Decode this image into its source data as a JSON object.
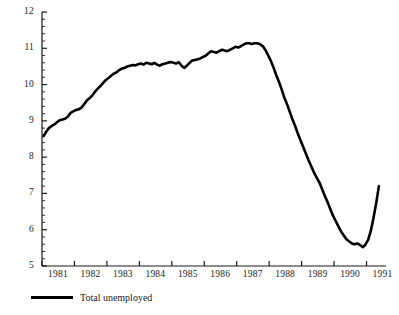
{
  "chart_data": {
    "type": "line",
    "title": "",
    "xlabel": "",
    "ylabel": "",
    "xlim": [
      1981.0,
      1991.6
    ],
    "ylim": [
      5,
      12
    ],
    "ytick_labels": [
      "5",
      "6",
      "7",
      "8",
      "9",
      "10",
      "11",
      "12"
    ],
    "ytick_values": [
      5,
      6,
      7,
      8,
      9,
      10,
      11,
      12
    ],
    "yminor_per_interval": 4,
    "xtick_labels": [
      "1981",
      "1982",
      "1983",
      "1984",
      "1985",
      "1986",
      "1987",
      "1988",
      "1989",
      "1990",
      "1991"
    ],
    "xtick_values": [
      1981,
      1982,
      1983,
      1984,
      1985,
      1986,
      1987,
      1988,
      1989,
      1990,
      1991
    ],
    "grid": false,
    "legend_position": "below-left",
    "series": [
      {
        "name": "Total unemployed",
        "color": "#000000",
        "line_width": 2.6,
        "x": [
          1981.05,
          1981.13,
          1981.21,
          1981.3,
          1981.38,
          1981.46,
          1981.55,
          1981.63,
          1981.71,
          1981.8,
          1981.88,
          1981.96,
          1982.05,
          1982.13,
          1982.21,
          1982.3,
          1982.38,
          1982.46,
          1982.55,
          1982.63,
          1982.71,
          1982.8,
          1982.88,
          1982.96,
          1983.05,
          1983.13,
          1983.21,
          1983.3,
          1983.38,
          1983.46,
          1983.55,
          1983.63,
          1983.71,
          1983.8,
          1983.88,
          1983.96,
          1984.05,
          1984.13,
          1984.21,
          1984.3,
          1984.38,
          1984.46,
          1984.55,
          1984.63,
          1984.71,
          1984.8,
          1984.88,
          1984.96,
          1985.05,
          1985.13,
          1985.21,
          1985.3,
          1985.38,
          1985.46,
          1985.55,
          1985.63,
          1985.71,
          1985.8,
          1985.88,
          1985.96,
          1986.05,
          1986.13,
          1986.21,
          1986.3,
          1986.38,
          1986.46,
          1986.55,
          1986.63,
          1986.71,
          1986.8,
          1986.88,
          1986.96,
          1987.05,
          1987.13,
          1987.21,
          1987.3,
          1987.38,
          1987.46,
          1987.55,
          1987.63,
          1987.71,
          1987.8,
          1987.88,
          1987.96,
          1988.05,
          1988.13,
          1988.21,
          1988.3,
          1988.38,
          1988.46,
          1988.55,
          1988.63,
          1988.71,
          1988.8,
          1988.88,
          1988.96,
          1989.05,
          1989.13,
          1989.21,
          1989.3,
          1989.38,
          1989.46,
          1989.55,
          1989.63,
          1989.71,
          1989.8,
          1989.88,
          1989.96,
          1990.05,
          1990.13,
          1990.21,
          1990.3,
          1990.38,
          1990.46,
          1990.55,
          1990.63,
          1990.71,
          1990.8,
          1990.88,
          1990.96,
          1991.05,
          1991.13,
          1991.21,
          1991.3,
          1991.38
        ],
        "y": [
          8.58,
          8.7,
          8.8,
          8.86,
          8.9,
          8.96,
          9.02,
          9.04,
          9.06,
          9.12,
          9.22,
          9.26,
          9.3,
          9.32,
          9.36,
          9.46,
          9.56,
          9.62,
          9.7,
          9.8,
          9.88,
          9.96,
          10.04,
          10.12,
          10.18,
          10.24,
          10.3,
          10.34,
          10.4,
          10.44,
          10.46,
          10.5,
          10.52,
          10.54,
          10.53,
          10.56,
          10.58,
          10.55,
          10.6,
          10.58,
          10.56,
          10.6,
          10.55,
          10.52,
          10.56,
          10.58,
          10.6,
          10.62,
          10.6,
          10.58,
          10.62,
          10.52,
          10.46,
          10.52,
          10.6,
          10.66,
          10.68,
          10.7,
          10.72,
          10.76,
          10.8,
          10.86,
          10.92,
          10.9,
          10.88,
          10.92,
          10.96,
          10.94,
          10.92,
          10.96,
          11.0,
          11.04,
          11.02,
          11.06,
          11.1,
          11.14,
          11.14,
          11.12,
          11.14,
          11.14,
          11.12,
          11.06,
          10.96,
          10.82,
          10.66,
          10.48,
          10.28,
          10.08,
          9.88,
          9.66,
          9.46,
          9.26,
          9.06,
          8.86,
          8.66,
          8.48,
          8.28,
          8.1,
          7.92,
          7.74,
          7.58,
          7.44,
          7.3,
          7.12,
          6.94,
          6.76,
          6.58,
          6.4,
          6.24,
          6.1,
          5.96,
          5.84,
          5.74,
          5.68,
          5.62,
          5.6,
          5.62,
          5.58,
          5.52,
          5.58,
          5.72,
          5.96,
          6.3,
          6.74,
          7.2
        ]
      }
    ]
  },
  "legend": {
    "label": "Total unemployed"
  }
}
